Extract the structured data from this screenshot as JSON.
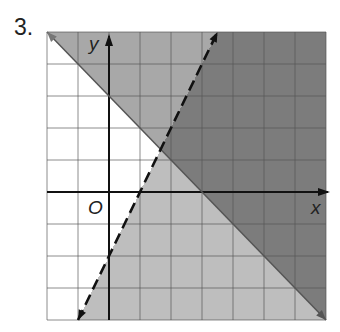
{
  "problem_number": "3.",
  "chart_data": {
    "type": "inequality-graph",
    "title": "",
    "xlabel": "x",
    "ylabel": "y",
    "origin_label": "O",
    "xlim": [
      -2,
      7
    ],
    "ylim": [
      -4,
      5
    ],
    "grid": true,
    "grid_step": 1,
    "lines": [
      {
        "name": "boundary-solid",
        "equation": "y = -x + 3",
        "slope": -1,
        "intercept": 3,
        "style": "solid",
        "from": [
          -2,
          5
        ],
        "to": [
          7,
          -4
        ]
      },
      {
        "name": "boundary-dashed",
        "equation": "y = 2x - 2",
        "slope": 2,
        "intercept": -2,
        "style": "dashed",
        "from": [
          -1,
          -4
        ],
        "to": [
          3.5,
          5
        ]
      }
    ],
    "regions": [
      {
        "name": "above-solid",
        "inequality": "y >= -x + 3",
        "shade": "medium"
      },
      {
        "name": "right-of-dashed",
        "inequality": "y < 2x - 2",
        "shade": "light"
      },
      {
        "name": "overlap",
        "inequality": "y >= -x + 3 and y < 2x - 2",
        "shade": "dark"
      }
    ]
  },
  "colors": {
    "dark": "#7c7c7c",
    "medium": "#a8a8a8",
    "light": "#bebebe",
    "white": "#ffffff",
    "grid": "#555555",
    "axis": "#111111"
  }
}
